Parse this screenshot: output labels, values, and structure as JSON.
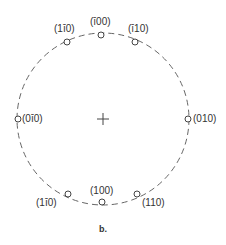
{
  "diagram": {
    "caption": "b.",
    "center_marker": "+",
    "circle_style": "dashed",
    "points": [
      {
        "label": "(1̅1̅̄)",
        "text": "(1ī0)",
        "pos": "top-left"
      },
      {
        "label": "(̄1̄00)",
        "text": "(ī00)",
        "pos": "top"
      },
      {
        "label": "(ī10)",
        "text": "(ī10)",
        "pos": "top-right"
      },
      {
        "label": "(0ī0)",
        "text": "(0ī0)",
        "pos": "left"
      },
      {
        "label": "(010)",
        "text": "(010)",
        "pos": "right"
      },
      {
        "label": "(1ī0)",
        "text": "(1ī0)",
        "pos": "bottom-left"
      },
      {
        "label": "(100)",
        "text": "(100)",
        "pos": "bottom"
      },
      {
        "label": "(110)",
        "text": "(110)",
        "pos": "bottom-right"
      }
    ]
  }
}
